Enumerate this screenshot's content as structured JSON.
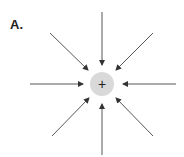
{
  "figure": {
    "label": "A.",
    "charge": {
      "symbol": "+",
      "fill": "#d9d9d9",
      "center": [
        102,
        84
      ],
      "radius": 12
    },
    "field_lines": {
      "count": 8,
      "direction": "inward",
      "color": "#333333"
    }
  }
}
